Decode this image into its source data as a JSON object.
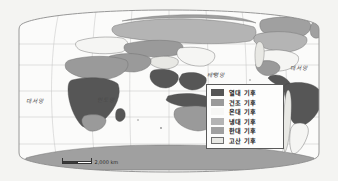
{
  "map": {
    "projection_shape": "robinson-oval",
    "background_color": "#f4f4f2",
    "ocean_color": "#fbfbfa",
    "frame_color": "#8c8c8c",
    "graticule_color": "#b8b8b8",
    "coastline_color": "#6e6e6e"
  },
  "ocean_labels": [
    {
      "name": "atlantic-west",
      "text": "대서양",
      "x": 26,
      "y": 97
    },
    {
      "name": "indian",
      "text": "인도양",
      "x": 97,
      "y": 96
    },
    {
      "name": "pacific",
      "text": "태평양",
      "x": 207,
      "y": 71
    },
    {
      "name": "atlantic-east",
      "text": "대서양",
      "x": 290,
      "y": 64
    }
  ],
  "legend": {
    "name": "climate-legend",
    "border_color": "#5a5a5a",
    "background_color": "#fdfdfc",
    "items": [
      {
        "label": "열대 기후",
        "color": "#565656",
        "outlined": false
      },
      {
        "label": "건조 기후",
        "color": "#9a9a9a",
        "outlined": false
      },
      {
        "label": "온대 기후",
        "color": "#f7f7f5",
        "outlined": false
      },
      {
        "label": "냉대 기후",
        "color": "#b4b4b4",
        "outlined": false
      },
      {
        "label": "한대 기후",
        "color": "#a0a0a0",
        "outlined": false
      },
      {
        "label": "고산 기후",
        "color": "#e8e8e4",
        "outlined": true
      }
    ]
  },
  "scalebar": {
    "label": "2,000 km",
    "segments": 2
  },
  "climate_regions": {
    "tropical_color": "#565656",
    "arid_color": "#9a9a9a",
    "temperate_color": "#f7f7f5",
    "subarctic_color": "#b4b4b4",
    "polar_color": "#a0a0a0",
    "highland_color": "#e8e8e4"
  }
}
